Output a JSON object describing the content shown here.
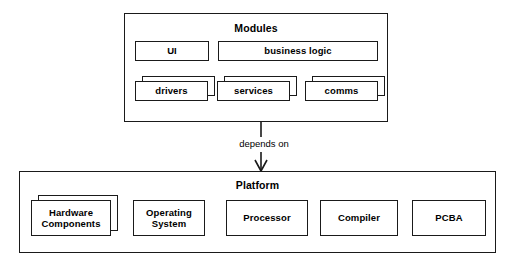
{
  "diagram": {
    "type": "layered-dependency-diagram",
    "background_color": "#ffffff",
    "line_color": "#1a1a1a",
    "groups": [
      {
        "id": "modules",
        "title": "Modules",
        "nodes": [
          {
            "id": "ui",
            "label": "UI",
            "style": "single"
          },
          {
            "id": "business-logic",
            "label": "business logic",
            "style": "single"
          },
          {
            "id": "drivers",
            "label": "drivers",
            "style": "stacked"
          },
          {
            "id": "services",
            "label": "services",
            "style": "stacked"
          },
          {
            "id": "comms",
            "label": "comms",
            "style": "stacked"
          }
        ]
      },
      {
        "id": "platform",
        "title": "Platform",
        "nodes": [
          {
            "id": "hardware-components",
            "label": "Hardware Components",
            "style": "stacked"
          },
          {
            "id": "operating-system",
            "label": "Operating System",
            "style": "single"
          },
          {
            "id": "processor",
            "label": "Processor",
            "style": "single"
          },
          {
            "id": "compiler",
            "label": "Compiler",
            "style": "single"
          },
          {
            "id": "pcba",
            "label": "PCBA",
            "style": "single"
          }
        ]
      }
    ],
    "connector": {
      "id": "modules-depends-on-platform",
      "label": "depends on",
      "from": "modules",
      "to": "platform",
      "arrow": "down"
    }
  }
}
